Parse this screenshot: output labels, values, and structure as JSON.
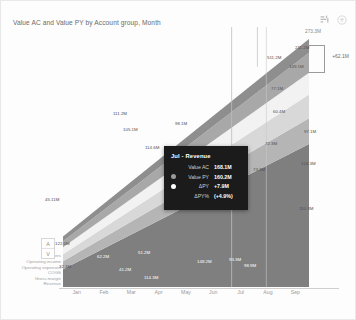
{
  "header": {
    "title": "Value AC and Value PY by Account group, Month",
    "icons": [
      {
        "name": "chart-settings-icon"
      },
      {
        "name": "info-circle-icon"
      }
    ]
  },
  "sort_toggle": {
    "up_label": "A",
    "down_label": "V"
  },
  "annotation": {
    "total_label": "273.3M",
    "variance_label": "+62.1M",
    "value_ac_label": "211.2M",
    "value_py_label": "149.1M"
  },
  "tooltip": {
    "title": "Jul - Revenue",
    "rows": [
      {
        "dot": false,
        "color": "#1b1b1b",
        "key": "Value AC",
        "value": "168.1M"
      },
      {
        "dot": true,
        "color": "#9a9a9a",
        "key": "Value PY",
        "value": "160.2M"
      },
      {
        "dot": true,
        "color": "#ffffff",
        "key": "ΔPY",
        "value": "+7.9M"
      },
      {
        "dot": false,
        "color": "#1b1b1b",
        "key": "ΔPY%",
        "value": "(+4.9%)"
      }
    ]
  },
  "colors": {
    "revenue": "#7f7f7f",
    "gross_margin": "#b5b5b5",
    "cogs": "#d8d8d8",
    "operating_expenses": "#f2f2f2",
    "operating_income": "#a8a8a8",
    "others": "#8e8e8e",
    "tooltip_bg": "#1b1b1b",
    "axis": "#cfcfcf"
  },
  "chart_data": {
    "type": "area",
    "title": "Value AC and Value PY by Account group, Month",
    "xlabel": "Month",
    "ylabel": "",
    "grid": false,
    "legend_position": "left",
    "categories": [
      "Jan",
      "Feb",
      "Mar",
      "Apr",
      "May",
      "Jun",
      "Jul",
      "Aug",
      "Sep"
    ],
    "legend": [
      "Others",
      "Operating income",
      "Operating expenses",
      "COGS",
      "Gross margin",
      "Revenue"
    ],
    "series": [
      {
        "name": "Revenue",
        "color": "#7f7f7f",
        "values": [
          22.0,
          44.0,
          61.0,
          80.0,
          99.0,
          118.0,
          168.1,
          182.0,
          196.0
        ]
      },
      {
        "name": "Gross margin",
        "color": "#b5b5b5",
        "values": [
          11.0,
          20.0,
          28.0,
          36.0,
          43.0,
          52.0,
          63.0,
          72.0,
          80.0
        ]
      },
      {
        "name": "COGS",
        "color": "#d8d8d8",
        "values": [
          10.0,
          19.0,
          27.0,
          35.0,
          42.0,
          50.0,
          61.0,
          70.0,
          78.0
        ]
      },
      {
        "name": "Operating expenses",
        "color": "#f2f2f2",
        "values": [
          8.0,
          16.0,
          23.0,
          30.0,
          38.0,
          46.0,
          56.0,
          64.0,
          72.0
        ]
      },
      {
        "name": "Operating income",
        "color": "#a8a8a8",
        "values": [
          6.0,
          12.0,
          18.0,
          24.0,
          30.0,
          37.0,
          44.0,
          51.0,
          58.0
        ]
      },
      {
        "name": "Others",
        "color": "#8e8e8e",
        "values": [
          5.0,
          10.0,
          15.0,
          20.0,
          25.0,
          31.0,
          38.0,
          44.0,
          50.0
        ]
      }
    ],
    "data_labels": [
      {
        "text": "22.4M",
        "x": 3,
        "y": 288,
        "tone": "white"
      },
      {
        "text": "32.3M",
        "x": 58,
        "y": 263,
        "tone": "mid"
      },
      {
        "text": "45.2M",
        "x": 12,
        "y": 275,
        "tone": "white"
      },
      {
        "text": "45.11M",
        "x": 44,
        "y": 196,
        "tone": "mid"
      },
      {
        "text": "122.0M",
        "x": 54,
        "y": 240,
        "tone": "mid"
      },
      {
        "text": "62.2M",
        "x": 96,
        "y": 253,
        "tone": "white"
      },
      {
        "text": "41.2M",
        "x": 118,
        "y": 266,
        "tone": "white"
      },
      {
        "text": "51.2M",
        "x": 137,
        "y": 249,
        "tone": "white"
      },
      {
        "text": "114.3M",
        "x": 143,
        "y": 274,
        "tone": "white"
      },
      {
        "text": "111.2M",
        "x": 112,
        "y": 110,
        "tone": "mid"
      },
      {
        "text": "105.1M",
        "x": 122,
        "y": 126,
        "tone": "mid"
      },
      {
        "text": "98.1M",
        "x": 174,
        "y": 120,
        "tone": "mid"
      },
      {
        "text": "114.6M",
        "x": 144,
        "y": 144,
        "tone": "mid"
      },
      {
        "text": "148.2M",
        "x": 196,
        "y": 258,
        "tone": "white"
      },
      {
        "text": "98.9M",
        "x": 243,
        "y": 262,
        "tone": "white"
      },
      {
        "text": "73.3M",
        "x": 252,
        "y": 166,
        "tone": "mid"
      },
      {
        "text": "72.3M",
        "x": 264,
        "y": 140,
        "tone": "mid"
      },
      {
        "text": "77.1M",
        "x": 270,
        "y": 85,
        "tone": "mid"
      },
      {
        "text": "60.4M",
        "x": 272,
        "y": 108,
        "tone": "mid"
      },
      {
        "text": "97.1M",
        "x": 303,
        "y": 128,
        "tone": "mid"
      },
      {
        "text": "124.3M",
        "x": 300,
        "y": 160,
        "tone": "mid"
      },
      {
        "text": "110.3M",
        "x": 298,
        "y": 205,
        "tone": "mid"
      },
      {
        "text": "211.2M",
        "x": 294,
        "y": 44,
        "tone": "mid"
      },
      {
        "text": "149.1M",
        "x": 288,
        "y": 63,
        "tone": "mid"
      },
      {
        "text": "511.2M",
        "x": 266,
        "y": 54,
        "tone": "mid"
      },
      {
        "text": "93.3M",
        "x": 228,
        "y": 256,
        "tone": "white"
      }
    ]
  }
}
